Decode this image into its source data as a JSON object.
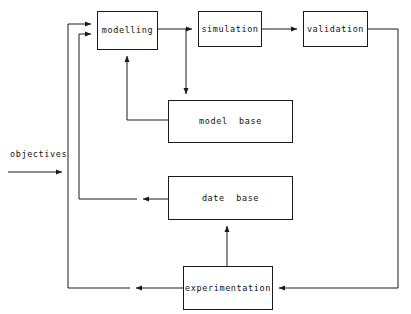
{
  "diagram": {
    "stroke_color": "#1a1a1a",
    "background_color": "#ffffff",
    "nodes": [
      {
        "id": "modelling",
        "label": "modelling",
        "x": 97,
        "y": 11,
        "w": 61,
        "h": 39
      },
      {
        "id": "simulation",
        "label": "simulation",
        "x": 198,
        "y": 11,
        "w": 64,
        "h": 36
      },
      {
        "id": "validation",
        "label": "validation",
        "x": 303,
        "y": 11,
        "w": 65,
        "h": 36
      },
      {
        "id": "model-base",
        "label": "model  base",
        "x": 168,
        "y": 100,
        "w": 125,
        "h": 43
      },
      {
        "id": "date-base",
        "label": "date  base",
        "x": 168,
        "y": 176,
        "w": 125,
        "h": 44
      },
      {
        "id": "experimentation",
        "label": "experimentation",
        "x": 183,
        "y": 266,
        "w": 90,
        "h": 44
      }
    ],
    "labels": [
      {
        "id": "objectives",
        "text": "objectives",
        "x": 10,
        "y": 150
      }
    ],
    "edges": [
      {
        "id": "objectives-to-modelling",
        "from": "objectives",
        "to": "modelling"
      },
      {
        "id": "modelling-to-simulation",
        "from": "modelling",
        "to": "simulation"
      },
      {
        "id": "simulation-to-validation",
        "from": "simulation",
        "to": "validation"
      },
      {
        "id": "modelling-to-model-base",
        "from": "modelling",
        "to": "model base"
      },
      {
        "id": "model-base-to-modelling",
        "from": "model base",
        "to": "modelling"
      },
      {
        "id": "date-base-to-modelling",
        "from": "date base",
        "to": "modelling"
      },
      {
        "id": "experimentation-to-date-base",
        "from": "experimentation",
        "to": "date base"
      },
      {
        "id": "validation-to-experimentation",
        "from": "validation",
        "to": "experimentation"
      },
      {
        "id": "experimentation-to-modelling",
        "from": "experimentation",
        "to": "modelling"
      }
    ]
  }
}
